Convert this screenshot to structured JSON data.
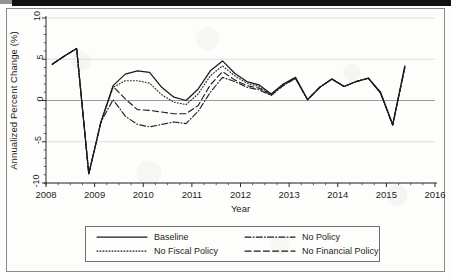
{
  "chart_data": {
    "type": "line",
    "title": "",
    "xlabel": "Year",
    "ylabel": "Annualized Percent Change (%)",
    "xlim": [
      2008,
      2016
    ],
    "ylim": [
      -10,
      10
    ],
    "yticks": [
      10,
      5,
      0,
      -5,
      -10
    ],
    "xticks": [
      2008,
      2009,
      2010,
      2011,
      2012,
      2013,
      2014,
      2015,
      2016
    ],
    "grid": "horizontal",
    "legend_position": "below",
    "x": [
      2008.13,
      2008.38,
      2008.63,
      2008.88,
      2009.13,
      2009.38,
      2009.63,
      2009.88,
      2010.13,
      2010.38,
      2010.63,
      2010.88,
      2011.13,
      2011.38,
      2011.63,
      2011.88,
      2012.13,
      2012.38,
      2012.63,
      2012.88,
      2013.13,
      2013.38,
      2013.63,
      2013.88,
      2014.13,
      2014.38,
      2014.63,
      2014.88,
      2015.13,
      2015.38
    ],
    "series": [
      {
        "name": "Baseline",
        "style": "solid",
        "color": "#1a1a1a",
        "values": [
          4.4,
          5.4,
          6.3,
          -8.9,
          -2.6,
          1.8,
          3.2,
          3.6,
          3.4,
          1.6,
          0.4,
          0.0,
          1.4,
          3.6,
          4.8,
          3.3,
          2.3,
          1.9,
          0.8,
          2.0,
          2.8,
          0.1,
          1.6,
          2.6,
          1.7,
          2.3,
          2.7,
          1.0,
          -2.9,
          4.2
        ]
      },
      {
        "name": "No Fiscal Policy",
        "style": "dotted",
        "color": "#2a2a2a",
        "values": [
          4.4,
          5.4,
          6.3,
          -8.9,
          -2.6,
          1.6,
          2.4,
          2.4,
          2.1,
          0.7,
          -0.2,
          -0.5,
          0.8,
          3.0,
          4.2,
          3.0,
          2.1,
          1.7,
          0.7,
          1.9,
          2.7,
          0.1,
          1.6,
          2.6,
          1.7,
          2.3,
          2.7,
          0.9,
          -3.0,
          4.0
        ]
      },
      {
        "name": "No Policy",
        "style": "dashdot",
        "color": "#232323",
        "values": [
          4.4,
          5.4,
          6.3,
          -8.9,
          -2.6,
          0.1,
          -1.9,
          -2.9,
          -3.2,
          -2.9,
          -2.6,
          -2.8,
          -1.3,
          1.0,
          2.8,
          2.3,
          1.6,
          1.3,
          0.6,
          1.8,
          2.7,
          0.1,
          1.6,
          2.6,
          1.7,
          2.3,
          2.7,
          0.9,
          -3.0,
          4.0
        ]
      },
      {
        "name": "No Financial Policy",
        "style": "dashed",
        "color": "#1f1f1f",
        "values": [
          4.4,
          5.4,
          6.3,
          -8.9,
          -2.6,
          1.7,
          0.2,
          -1.1,
          -1.2,
          -1.4,
          -1.6,
          -1.6,
          -0.6,
          1.9,
          3.5,
          2.5,
          1.8,
          1.5,
          0.7,
          1.9,
          2.7,
          0.1,
          1.6,
          2.6,
          1.7,
          2.3,
          2.7,
          0.9,
          -3.0,
          4.0
        ]
      }
    ]
  },
  "legend": {
    "items": [
      {
        "label": "Baseline",
        "style": "solid"
      },
      {
        "label": "No Policy",
        "style": "dashdot"
      },
      {
        "label": "No Fiscal Policy",
        "style": "dotted"
      },
      {
        "label": "No Financial Policy",
        "style": "dashed"
      }
    ]
  }
}
